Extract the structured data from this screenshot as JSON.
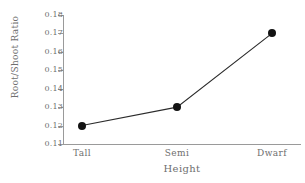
{
  "chart_data": {
    "type": "line",
    "title": "",
    "xlabel": "Height",
    "ylabel": "Root/Shoot Ratio",
    "categories": [
      "Tall",
      "Semi",
      "Dwarf"
    ],
    "values": [
      0.12,
      0.13,
      0.17
    ],
    "ylim": [
      0.11,
      0.18
    ],
    "yticks": [
      "0.11",
      "0.12",
      "0.13",
      "0.14",
      "0.15",
      "0.16",
      "0.17",
      "0.18"
    ],
    "ytick_values": [
      0.11,
      0.12,
      0.13,
      0.14,
      0.15,
      0.16,
      0.17,
      0.18
    ],
    "grid": false,
    "legend": "none",
    "marker": "filled-circle",
    "line_color": "#2b2b2b",
    "marker_color": "#131313",
    "axis_color": "#9a9a9a",
    "text_color": "#6f6f6f"
  }
}
